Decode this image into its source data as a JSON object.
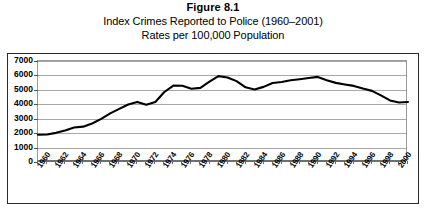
{
  "figure": {
    "number_label": "Figure 8.1",
    "title_line1": "Index Crimes Reported to Police (1960–2001)",
    "title_line2": "Rates per 100,000 Population"
  },
  "colors": {
    "line": "#000000",
    "gridline": "#a8a8a8",
    "frame": "#2b2b2b",
    "background": "#ffffff",
    "text": "#000000"
  },
  "chart_data": {
    "type": "line",
    "title": "Index Crimes Reported to Police (1960–2001)",
    "subtitle": "Rates per 100,000 Population",
    "xlabel": "",
    "ylabel": "",
    "ylim": [
      0,
      7000
    ],
    "ytick_step": 1000,
    "grid": true,
    "legend": false,
    "xlim": [
      1960,
      2001
    ],
    "y_ticks": [
      0,
      1000,
      2000,
      3000,
      4000,
      5000,
      6000,
      7000
    ],
    "y_tick_labels": [
      "0",
      "1000",
      "2000",
      "3000",
      "4000",
      "5000",
      "6000",
      "7000"
    ],
    "x_tick_labels": [
      "1960",
      "1962",
      "1964",
      "1966",
      "1968",
      "1970",
      "1972",
      "1974",
      "1976",
      "1978",
      "1980",
      "1982",
      "1984",
      "1986",
      "1988",
      "1990",
      "1992",
      "1994",
      "1996",
      "1998",
      "2000"
    ],
    "x": [
      1960,
      1961,
      1962,
      1963,
      1964,
      1965,
      1966,
      1967,
      1968,
      1969,
      1970,
      1971,
      1972,
      1973,
      1974,
      1975,
      1976,
      1977,
      1978,
      1979,
      1980,
      1981,
      1982,
      1983,
      1984,
      1985,
      1986,
      1987,
      1988,
      1989,
      1990,
      1991,
      1992,
      1993,
      1994,
      1995,
      1996,
      1997,
      1998,
      1999,
      2000,
      2001
    ],
    "series": [
      {
        "name": "Index crime rate per 100,000",
        "values": [
          1887,
          1906,
          2020,
          2180,
          2388,
          2449,
          2671,
          2989,
          3370,
          3680,
          3985,
          4165,
          3961,
          4154,
          4850,
          5298,
          5287,
          5078,
          5140,
          5566,
          5950,
          5858,
          5604,
          5175,
          5031,
          5207,
          5480,
          5550,
          5664,
          5741,
          5820,
          5898,
          5661,
          5484,
          5374,
          5275,
          5087,
          4930,
          4620,
          4267,
          4125,
          4163
        ]
      }
    ]
  }
}
